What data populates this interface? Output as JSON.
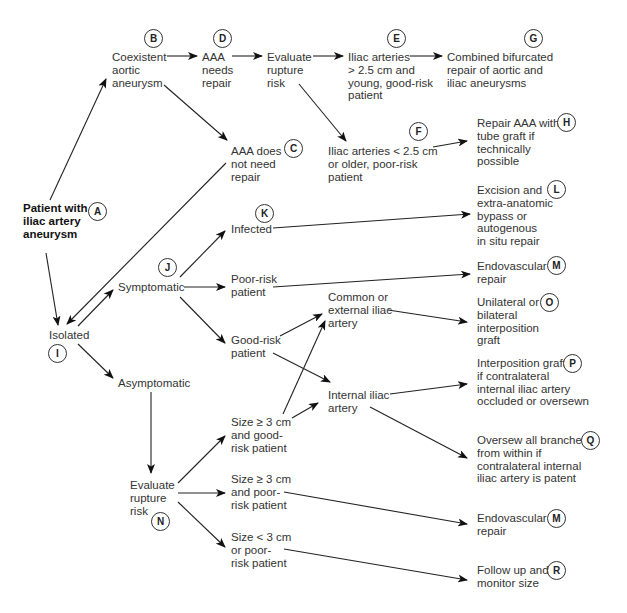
{
  "diagram": {
    "type": "flowchart",
    "nodes": [
      {
        "id": "A",
        "label": "Patient with\niliac artery\naneurysm",
        "bold": true
      },
      {
        "id": "B",
        "label": "Coexistent\naortic\naneurysm"
      },
      {
        "id": "C",
        "label": "AAA does\nnot need\nrepair"
      },
      {
        "id": "D",
        "label": "AAA\nneeds\nrepair"
      },
      {
        "id": "D2",
        "label": "Evaluate\nrupture\nrisk"
      },
      {
        "id": "E",
        "label": "Iliac arteries\n> 2.5 cm and\nyoung, good-risk\npatient"
      },
      {
        "id": "F",
        "label": "Iliac arteries < 2.5 cm\nor older, poor-risk\npatient"
      },
      {
        "id": "G",
        "label": "Combined bifurcated\nrepair of aortic and\niliac aneurysms"
      },
      {
        "id": "H",
        "label": "Repair AAA with\ntube graft if\ntechnically\npossible"
      },
      {
        "id": "I",
        "label": "Isolated"
      },
      {
        "id": "J",
        "label": "Symptomatic"
      },
      {
        "id": "K",
        "label": "Infected"
      },
      {
        "id": "J2",
        "label": "Poor-risk\npatient"
      },
      {
        "id": "J3",
        "label": "Good-risk\npatient"
      },
      {
        "id": "L",
        "label": "Excision and\nextra-anatomic\nbypass or\nautogenous\nin situ repair"
      },
      {
        "id": "M",
        "label": "Endovascular\nrepair"
      },
      {
        "id": "CE",
        "label": "Common or\nexternal iliac\nartery"
      },
      {
        "id": "O",
        "label": "Unilateral or\nbilateral\ninterposition\ngraft"
      },
      {
        "id": "II",
        "label": "Internal iliac\nartery"
      },
      {
        "id": "P",
        "label": "Interposition graft\nif contralateral\ninternal iliac artery\noccluded or oversewn"
      },
      {
        "id": "Q",
        "label": "Oversew all branches\nfrom within if\ncontralateral internal\niliac artery is patent"
      },
      {
        "id": "AS",
        "label": "Asymptomatic"
      },
      {
        "id": "N",
        "label": "Evaluate\nrupture\nrisk"
      },
      {
        "id": "S1",
        "label": "Size ≥ 3 cm\nand good-\nrisk patient"
      },
      {
        "id": "S2",
        "label": "Size ≥ 3 cm\nand poor-\nrisk patient"
      },
      {
        "id": "S3",
        "label": "Size < 3 cm\nor poor-\nrisk patient"
      },
      {
        "id": "M2",
        "label": "Endovascular\nrepair"
      },
      {
        "id": "R",
        "label": "Follow up and\nmonitor size"
      }
    ],
    "badges": {
      "A": "A",
      "B": "B",
      "C": "C",
      "D": "D",
      "E": "E",
      "F": "F",
      "G": "G",
      "H": "H",
      "I": "I",
      "J": "J",
      "K": "K",
      "L": "L",
      "M": "M",
      "N": "N",
      "O": "O",
      "P": "P",
      "Q": "Q",
      "M2": "M",
      "R": "R"
    },
    "edges": [
      [
        "A",
        "B"
      ],
      [
        "A",
        "I"
      ],
      [
        "B",
        "D"
      ],
      [
        "B",
        "C"
      ],
      [
        "D",
        "D2"
      ],
      [
        "D2",
        "E"
      ],
      [
        "D2",
        "F"
      ],
      [
        "E",
        "G"
      ],
      [
        "F",
        "H"
      ],
      [
        "C",
        "I"
      ],
      [
        "I",
        "J"
      ],
      [
        "I",
        "AS"
      ],
      [
        "J",
        "K"
      ],
      [
        "J",
        "J2"
      ],
      [
        "J",
        "J3"
      ],
      [
        "K",
        "L"
      ],
      [
        "J2",
        "M"
      ],
      [
        "J3",
        "CE"
      ],
      [
        "J3",
        "II"
      ],
      [
        "CE",
        "O"
      ],
      [
        "II",
        "P"
      ],
      [
        "II",
        "Q"
      ],
      [
        "AS",
        "N"
      ],
      [
        "N",
        "S1"
      ],
      [
        "N",
        "S2"
      ],
      [
        "N",
        "S3"
      ],
      [
        "S1",
        "CE"
      ],
      [
        "S1",
        "II"
      ],
      [
        "S2",
        "M2"
      ],
      [
        "S3",
        "R"
      ]
    ]
  }
}
